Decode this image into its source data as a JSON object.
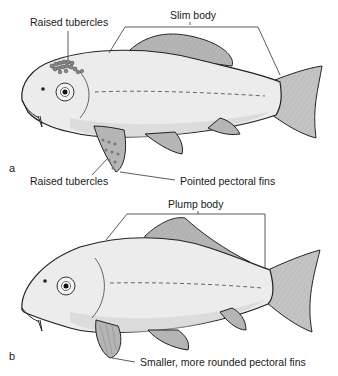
{
  "figure": {
    "panel_a": {
      "panel_label": "a",
      "labels": {
        "body": "Slim body",
        "tubercles_head": "Raised tubercles",
        "tubercles_fin": "Raised tubercles",
        "pectoral_fins": "Pointed pectoral fins"
      }
    },
    "panel_b": {
      "panel_label": "b",
      "labels": {
        "body": "Plump body",
        "pectoral_fins": "Smaller, more rounded pectoral fins"
      }
    }
  }
}
